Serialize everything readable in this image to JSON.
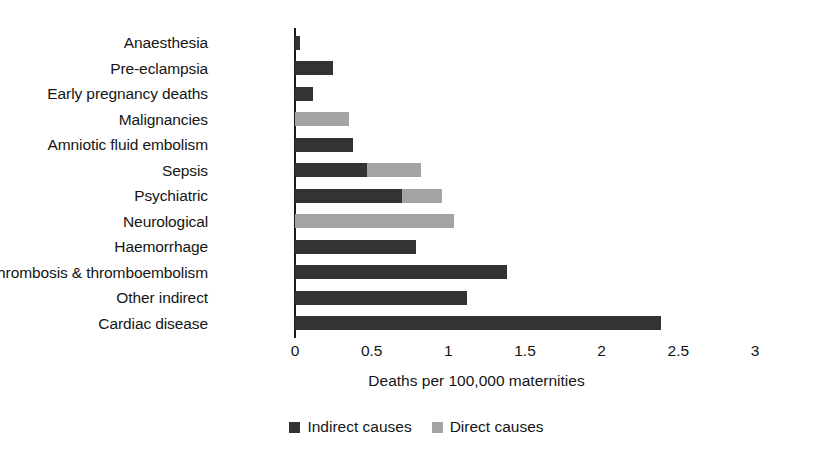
{
  "chart_data": {
    "type": "bar",
    "orientation": "horizontal",
    "title": "",
    "xlabel": "Deaths per 100,000 maternities",
    "ylabel": "",
    "xlim": [
      0,
      3
    ],
    "xticks": [
      "0",
      "0.5",
      "1",
      "1.5",
      "2",
      "2.5",
      "3"
    ],
    "xtick_values": [
      0,
      0.5,
      1,
      1.5,
      2,
      2.5,
      3
    ],
    "grid": false,
    "legend_position": "bottom-center",
    "categories": [
      "Anaesthesia",
      "Pre-eclampsia",
      "Early pregnancy deaths",
      "Malignancies",
      "Amniotic fluid embolism",
      "Sepsis",
      "Psychiatric",
      "Neurological",
      "Haemorrhage",
      "Thrombosis & thromboembolism",
      "Other indirect",
      "Cardiac disease"
    ],
    "series": [
      {
        "name": "Indirect causes",
        "color": "#333333",
        "values": [
          0.03,
          0.25,
          0.12,
          0,
          0.38,
          0.47,
          0.7,
          0,
          0.79,
          1.38,
          1.12,
          2.39
        ]
      },
      {
        "name": "Direct causes",
        "color": "#a4a4a4",
        "values": [
          0,
          0,
          0,
          0.35,
          0,
          0.82,
          0.96,
          1.04,
          0,
          0,
          0,
          0
        ]
      }
    ]
  },
  "legend": {
    "items": [
      {
        "label": "Indirect causes",
        "swatch": "indirect"
      },
      {
        "label": "Direct causes",
        "swatch": "direct"
      }
    ]
  }
}
